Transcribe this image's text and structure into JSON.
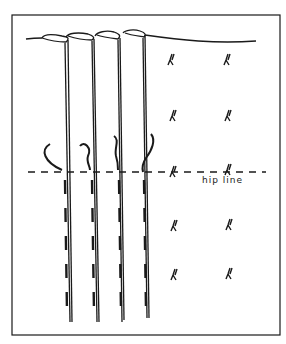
{
  "diagram": {
    "type": "sewing-pleats-illustration",
    "labels": {
      "hip_line": "hip line"
    },
    "pleats_count": 4,
    "tack_columns": 2,
    "tack_rows": 5,
    "colors": {
      "ink": "#1a1a1a",
      "background": "#ffffff"
    }
  }
}
